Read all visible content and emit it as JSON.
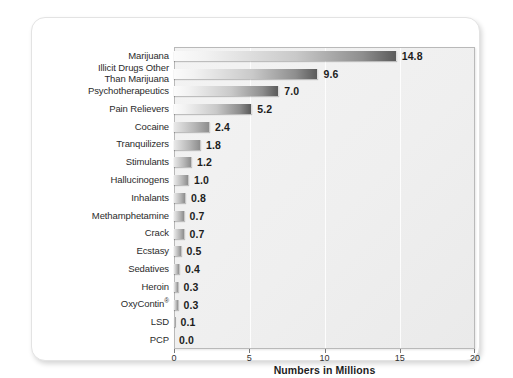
{
  "chart_data": {
    "type": "bar",
    "orientation": "horizontal",
    "title": "",
    "xlabel": "Numbers in Millions",
    "ylabel": "",
    "xlim": [
      0,
      20
    ],
    "xticks": [
      "0",
      "5",
      "10",
      "15",
      "20"
    ],
    "grid": true,
    "legend": null,
    "categories": [
      "Marijuana",
      "Illicit Drugs Other\nThan Marijuana",
      "Psychotherapeutics",
      "Pain Relievers",
      "Cocaine",
      "Tranquilizers",
      "Stimulants",
      "Hallucinogens",
      "Inhalants",
      "Methamphetamine",
      "Crack",
      "Ecstasy",
      "Sedatives",
      "Heroin",
      "OxyContin",
      "LSD",
      "PCP"
    ],
    "values": [
      14.8,
      9.6,
      7.0,
      5.2,
      2.4,
      1.8,
      1.2,
      1.0,
      0.8,
      0.7,
      0.7,
      0.5,
      0.4,
      0.3,
      0.3,
      0.1,
      0.0
    ],
    "value_labels": [
      "14.8",
      "9.6",
      "7.0",
      "5.2",
      "2.4",
      "1.8",
      "1.2",
      "1.0",
      "0.8",
      "0.7",
      "0.7",
      "0.5",
      "0.4",
      "0.3",
      "0.3",
      "0.1",
      "0.0"
    ],
    "category_superscripts": [
      "",
      "",
      "",
      "",
      "",
      "",
      "",
      "",
      "",
      "",
      "",
      "",
      "",
      "",
      "®",
      "",
      ""
    ]
  },
  "colors": {
    "bar_gradient_start": "#fbfbfb",
    "bar_gradient_end": "#5a5a5a",
    "panel_background": "#efefef",
    "panel_border": "#b9b9b9",
    "card_background": "#ffffff",
    "text": "#1d1d1d",
    "category_text": "#2b2b2b"
  }
}
